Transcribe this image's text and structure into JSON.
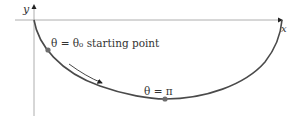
{
  "axes": {
    "x_label": "x",
    "y_label": "y"
  },
  "curve": {
    "description": "cycloid-like arc from origin down to minimum and back up to x-axis",
    "color": "#4a4a4a"
  },
  "points": [
    {
      "name": "starting-point",
      "label": "θ = θ₀ starting point",
      "color": "#6e6e6e"
    },
    {
      "name": "minimum-point",
      "label": "θ = π",
      "color": "#6e6e6e"
    }
  ],
  "direction_arrow": {
    "meaning": "direction of motion along curve"
  }
}
